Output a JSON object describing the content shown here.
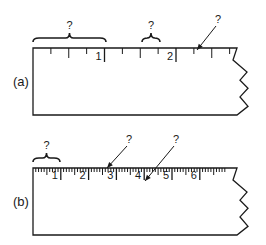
{
  "colors": {
    "ink": "#1a1a1a",
    "background": "#ffffff"
  },
  "figure_a": {
    "label": "(a)",
    "label_pos": [
      13,
      86
    ],
    "ruler": {
      "x0": 33,
      "y_top": 48,
      "y_bottom": 115,
      "x_right": 237,
      "unit_px": 71.5,
      "subdivisions": 4,
      "major_tick_len": 14,
      "minor_tick_len": 6,
      "mid_tick_len": 10,
      "labels": [
        "1",
        "2"
      ],
      "num_units": 2.9
    },
    "questions": [
      {
        "type": "brace",
        "text": "?",
        "x1": 33,
        "x2": 106,
        "y": 40
      },
      {
        "type": "brace",
        "text": "?",
        "x1": 142,
        "x2": 160,
        "y": 40
      },
      {
        "type": "arrow",
        "text": "?",
        "from": [
          216,
          26
        ],
        "to": [
          197,
          50
        ]
      }
    ]
  },
  "figure_b": {
    "label": "(b)",
    "label_pos": [
      13,
      206
    ],
    "ruler": {
      "x0": 33,
      "y_top": 168,
      "y_bottom": 235,
      "x_right": 237,
      "unit_px": 27.8,
      "subdivisions": 10,
      "major_tick_len": 12,
      "minor_tick_len": 4,
      "mid_tick_len": 7,
      "labels": [
        "1",
        "2",
        "3",
        "4",
        "5",
        "6"
      ],
      "num_units": 6.95
    },
    "questions": [
      {
        "type": "brace",
        "text": "?",
        "x1": 33,
        "x2": 60,
        "y": 160
      },
      {
        "type": "arrow",
        "text": "?",
        "from": [
          127,
          146
        ],
        "to": [
          107,
          168
        ]
      },
      {
        "type": "arrow",
        "text": "?",
        "from": [
          174,
          146
        ],
        "to": [
          145,
          181
        ]
      }
    ]
  }
}
